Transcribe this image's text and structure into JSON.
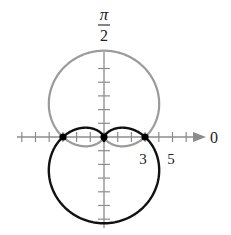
{
  "chart_data": {
    "type": "line",
    "coordinate_system": "polar",
    "title": "",
    "axis_labels": {
      "polar_axis": "0",
      "vertical_axis": "π/2"
    },
    "tick_labels": [
      "3",
      "5"
    ],
    "tick_spacing": 1,
    "axis_range": [
      -6,
      6
    ],
    "grid": false,
    "legend": null,
    "series": [
      {
        "name": "upper limaçon",
        "equation": "r = 3 + 3.3 sin θ",
        "color": "#9a9a9a",
        "max_r_up": 6.3,
        "inner_loop_r": 0.3
      },
      {
        "name": "lower limaçon",
        "equation": "r = 3 - 3.3 sin θ",
        "color": "#111111",
        "max_r_down": 6.3,
        "inner_loop_r": 0.3
      }
    ],
    "intersection_points": [
      {
        "r": 3,
        "theta": "0",
        "x": 3,
        "y": 0
      },
      {
        "r": 3,
        "theta": "π",
        "x": -3,
        "y": 0
      },
      {
        "r": 0,
        "theta": "pole",
        "x": 0,
        "y": 0
      }
    ]
  },
  "labels": {
    "pi": "π",
    "two": "2",
    "zero": "0",
    "three": "3",
    "five": "5"
  }
}
